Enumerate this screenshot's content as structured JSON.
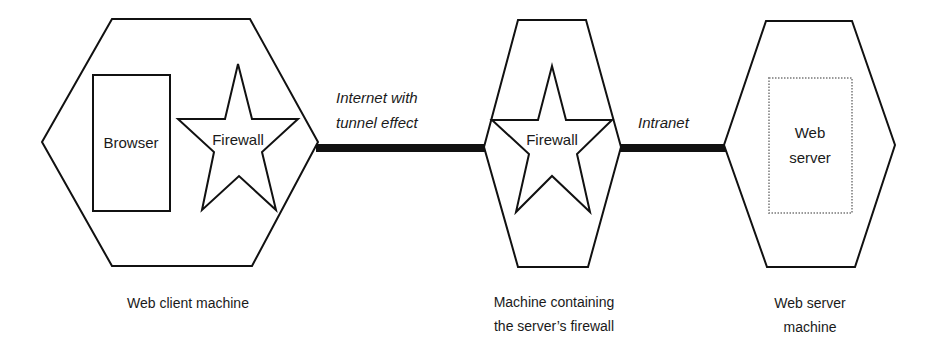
{
  "diagram": {
    "nodes": [
      {
        "id": "web-client-machine",
        "label": "Web client machine",
        "contains": [
          {
            "type": "rectangle",
            "label": "Browser"
          },
          {
            "type": "star",
            "label": "Firewall"
          }
        ]
      },
      {
        "id": "firewall-machine",
        "label_lines": [
          "Machine containing",
          "the server’s firewall"
        ],
        "contains": [
          {
            "type": "star",
            "label": "Firewall"
          }
        ]
      },
      {
        "id": "web-server-machine",
        "label_lines": [
          "Web server",
          "machine"
        ],
        "contains": [
          {
            "type": "dotted-rectangle",
            "label_lines": [
              "Web",
              "server"
            ]
          }
        ]
      }
    ],
    "edges": [
      {
        "from": "web-client-machine",
        "to": "firewall-machine",
        "label_lines": [
          "Internet with",
          "tunnel effect"
        ]
      },
      {
        "from": "firewall-machine",
        "to": "web-server-machine",
        "label": "Intranet"
      }
    ],
    "colors": {
      "stroke": "#111111",
      "dotted": "#999999",
      "background": "#ffffff"
    }
  }
}
